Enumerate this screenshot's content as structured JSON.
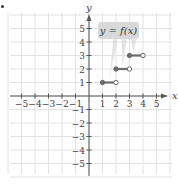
{
  "chart_data": {
    "type": "line",
    "title": "",
    "function_label": "y = f(x)",
    "xlabel": "x",
    "ylabel": "y",
    "xlim": [
      -5,
      5
    ],
    "ylim": [
      -5,
      5
    ],
    "grid": true,
    "x_ticks": [
      -5,
      -4,
      -3,
      -2,
      -1,
      1,
      2,
      3,
      4,
      5
    ],
    "y_ticks": [
      -5,
      -4,
      -3,
      -2,
      -1,
      1,
      2,
      3,
      4,
      5
    ],
    "x_tick_labels": [
      "−5",
      "−4",
      "−3",
      "−2",
      "−1",
      "1",
      "2",
      "3",
      "4",
      "5"
    ],
    "y_tick_labels": [
      "5",
      "4",
      "3",
      "2",
      "1",
      "−1",
      "−2",
      "−3",
      "−4",
      "−5"
    ],
    "series": [
      {
        "name": "f(x) step segments",
        "segments": [
          {
            "x_start": 1,
            "x_end": 2,
            "y": 1,
            "start_closed": true,
            "end_closed": false
          },
          {
            "x_start": 2,
            "x_end": 3,
            "y": 2,
            "start_closed": true,
            "end_closed": false
          },
          {
            "x_start": 3,
            "x_end": 4,
            "y": 3,
            "start_closed": true,
            "end_closed": false
          }
        ]
      }
    ]
  },
  "colors": {
    "grid": "#e2e2e2",
    "axis": "#555555",
    "segment": "#6b6b6b",
    "label_box": "#d9d9d9",
    "text": "#444444"
  }
}
